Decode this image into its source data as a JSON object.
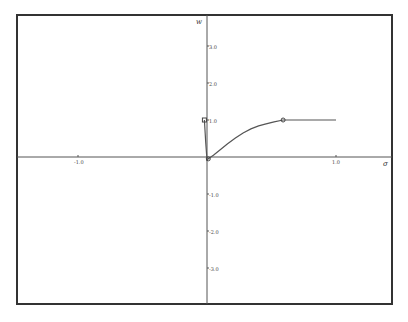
{
  "chart_data": {
    "type": "line",
    "title": "",
    "xlabel": "σ",
    "ylabel": "w",
    "xlim": [
      -1.5,
      1.4
    ],
    "ylim": [
      -3.9,
      3.7
    ],
    "grid": false,
    "legend": null,
    "x_ticks": [
      {
        "value": -1.0,
        "label": "-1.0"
      },
      {
        "value": 1.0,
        "label": "1.0"
      }
    ],
    "y_ticks": [
      {
        "value": 3.0,
        "label": "3.0"
      },
      {
        "value": 2.0,
        "label": "2.0"
      },
      {
        "value": 1.0,
        "label": "1.0"
      },
      {
        "value": -1.0,
        "label": "-1.0"
      },
      {
        "value": -2.0,
        "label": "-2.0"
      },
      {
        "value": -3.0,
        "label": "-3.0"
      }
    ],
    "series": [
      {
        "name": "curve",
        "x": [
          -0.02,
          -0.01,
          0.0,
          0.01,
          0.05,
          0.1,
          0.16,
          0.22,
          0.28,
          0.34,
          0.4,
          0.45,
          0.52,
          0.59,
          0.7,
          0.85,
          1.0
        ],
        "y": [
          1.0,
          0.4,
          -0.08,
          -0.05,
          0.05,
          0.19,
          0.36,
          0.51,
          0.65,
          0.76,
          0.84,
          0.89,
          0.95,
          1.0,
          1.0,
          1.0,
          1.0
        ]
      }
    ],
    "markers": [
      {
        "shape": "square",
        "x": -0.02,
        "y": 1.0
      },
      {
        "shape": "circle",
        "x": 0.01,
        "y": -0.05
      },
      {
        "shape": "circle",
        "x": 0.59,
        "y": 1.0
      }
    ]
  },
  "layout": {
    "frame": {
      "left": 17,
      "top": 15,
      "right": 392,
      "bottom": 304
    },
    "origin_px": {
      "x": 207,
      "y": 157
    },
    "unit_px": {
      "x": 129,
      "y": 37
    },
    "line_color": "#555555",
    "frame_color": "#333333"
  }
}
